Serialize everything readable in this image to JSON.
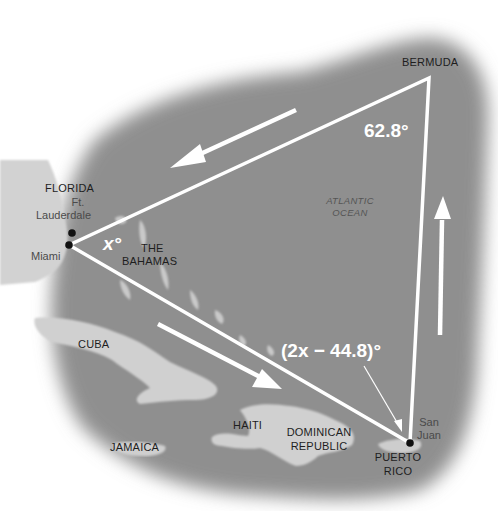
{
  "figure": {
    "type": "map"
  },
  "colors": {
    "sea": "#8f8f8f",
    "land": "#cfcfcf",
    "lines": "#ffffff",
    "label_dark": "#1e1e1e",
    "label_city": "#4a4a4a",
    "dot": "#111111"
  },
  "places": {
    "florida": "FLORIDA",
    "ft_lauderdale_1": "Ft.",
    "ft_lauderdale_2": "Lauderdale",
    "miami": "Miami",
    "bahamas_1": "THE",
    "bahamas_2": "BAHAMAS",
    "cuba": "CUBA",
    "jamaica": "JAMAICA",
    "haiti": "HAITI",
    "dominican_1": "DOMINICAN",
    "dominican_2": "REPUBLIC",
    "puerto_rico_1": "PUERTO",
    "puerto_rico_2": "RICO",
    "san_juan_1": "San",
    "san_juan_2": "Juan",
    "bermuda": "BERMUDA",
    "ocean_1": "ATLANTIC",
    "ocean_2": "OCEAN"
  },
  "triangle": {
    "vertices": {
      "miami": [
        69,
        245
      ],
      "bermuda": [
        429,
        78
      ],
      "puerto_rico": [
        410,
        443
      ]
    },
    "angles": {
      "miami": "x°",
      "bermuda": "62.8°",
      "puerto_rico": "(2x − 44.8)°"
    }
  }
}
